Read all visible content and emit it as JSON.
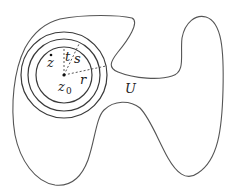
{
  "diagram": {
    "region": {
      "label": "U"
    },
    "center": {
      "label": "z",
      "subscript": "0"
    },
    "point": {
      "label": "z"
    },
    "radii": [
      {
        "label": "t"
      },
      {
        "label": "s"
      },
      {
        "label": "r"
      }
    ],
    "colors": {
      "stroke": "#555555",
      "text": "#222222",
      "background": "#ffffff"
    }
  }
}
